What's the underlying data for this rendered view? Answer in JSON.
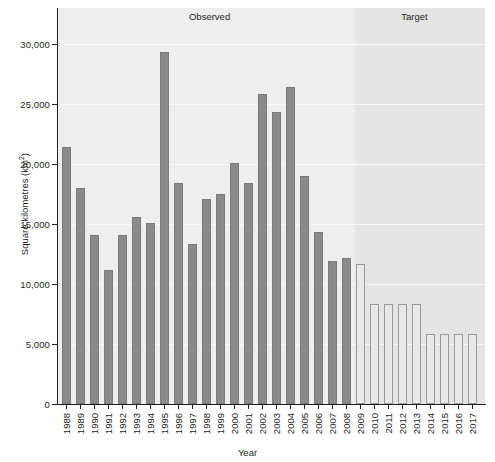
{
  "chart_data": {
    "type": "bar",
    "title": "",
    "xlabel": "Year",
    "ylabel": "Square kilometres (km²)",
    "ylabel_base": "Square kilometres (km",
    "ylabel_sup": "2",
    "ylabel_close": ")",
    "ylim": [
      0,
      31500
    ],
    "yticks": [
      0,
      5000,
      10000,
      15000,
      20000,
      25000,
      30000
    ],
    "ytick_labels": [
      "0",
      "5,000",
      "10,000",
      "15,000",
      "20,000",
      "25,000",
      "30,000"
    ],
    "grid": true,
    "legend_position": "none",
    "categories": [
      "1988",
      "1989",
      "1990",
      "1991",
      "1992",
      "1993",
      "1994",
      "1995",
      "1996",
      "1997",
      "1998",
      "1999",
      "2000",
      "2001",
      "2002",
      "2003",
      "2004",
      "2005",
      "2006",
      "2007",
      "2008",
      "2009",
      "2010",
      "2011",
      "2012",
      "2013",
      "2014",
      "2015",
      "2016",
      "2017"
    ],
    "values": [
      21400,
      18000,
      14100,
      11200,
      14100,
      15600,
      15100,
      29300,
      18400,
      13300,
      17100,
      17500,
      20100,
      18400,
      25800,
      24300,
      26400,
      19000,
      14300,
      11900,
      12200,
      11700,
      8300,
      8300,
      8300,
      8300,
      5800,
      5800,
      5800,
      5800
    ],
    "series_kind": [
      "observed",
      "observed",
      "observed",
      "observed",
      "observed",
      "observed",
      "observed",
      "observed",
      "observed",
      "observed",
      "observed",
      "observed",
      "observed",
      "observed",
      "observed",
      "observed",
      "observed",
      "observed",
      "observed",
      "observed",
      "observed",
      "target",
      "target",
      "target",
      "target",
      "target",
      "target",
      "target",
      "target",
      "target"
    ],
    "annotations": [
      {
        "text": "Observed",
        "x_center_frac": 0.355
      },
      {
        "text": "Target",
        "x_center_frac": 0.835
      }
    ],
    "colors": {
      "observed_bar": "#8a8a8a",
      "observed_bar_edge": "#7a7a7a",
      "target_bar": "#e8e8e8",
      "target_bar_edge": "#9a9a9a",
      "band_observed": "#eeeeee",
      "band_target": "#e4e4e4",
      "gridline": "#f8f8f8",
      "axis": "#231f20",
      "text": "#231f20"
    }
  }
}
